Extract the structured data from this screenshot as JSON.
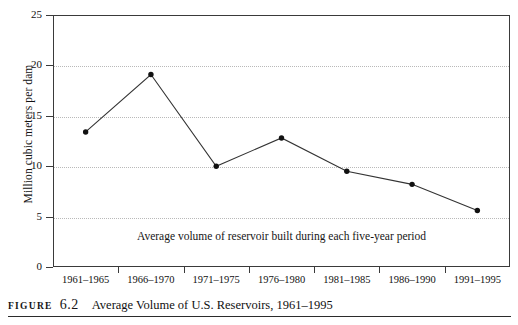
{
  "figure": {
    "label_word": "FIGURE",
    "number": "6.2",
    "title": "Average Volume of U.S. Reservoirs, 1961–1995"
  },
  "annotation": "Average volume of reservoir built during each five-year period",
  "chart_data": {
    "type": "line",
    "title": "",
    "subtitle": "",
    "xlabel": "",
    "ylabel": "Million cubic meters per dam",
    "categories": [
      "1961–1965",
      "1966–1970",
      "1971–1975",
      "1976–1980",
      "1981–1985",
      "1986–1990",
      "1991–1995"
    ],
    "values": [
      13.4,
      19.1,
      10.0,
      12.8,
      9.5,
      8.2,
      5.6
    ],
    "ylim": [
      0,
      25
    ],
    "yticks": [
      0,
      5,
      10,
      15,
      20,
      25
    ],
    "ytick_labels": [
      "0",
      "5",
      "10",
      "15",
      "20",
      "25"
    ],
    "grid": "horizontal-dotted",
    "legend": "none",
    "marker": "filled-circle",
    "line_color": "#333333",
    "marker_color": "#111111",
    "grid_color": "#b9b9b9",
    "axis_color": "#3a3a3a",
    "annotations": [
      {
        "text": "Average volume of reservoir built during each five-year period",
        "position": "inside-bottom-center"
      }
    ]
  }
}
